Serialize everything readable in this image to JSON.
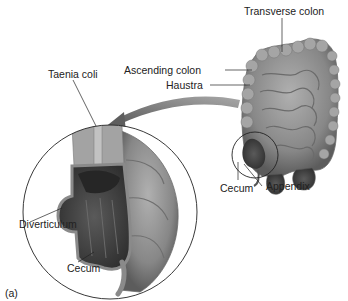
{
  "figure": {
    "panel_label": "(a)",
    "labels": {
      "transverse_colon": "Transverse colon",
      "ascending_colon": "Ascending colon",
      "haustra": "Haustra",
      "taenia_coli": "Taenia coli",
      "cecum_main": "Cecum",
      "appendix": "Appendix",
      "diverticulum": "Diverticulum",
      "cecum_inset": "Cecum"
    },
    "colors": {
      "tissue_light": "#9a9a9a",
      "tissue_mid": "#7a7a7a",
      "tissue_dark": "#4a4a4a",
      "arrow": "#6d6d6d",
      "line": "#222222",
      "background": "#ffffff"
    }
  }
}
